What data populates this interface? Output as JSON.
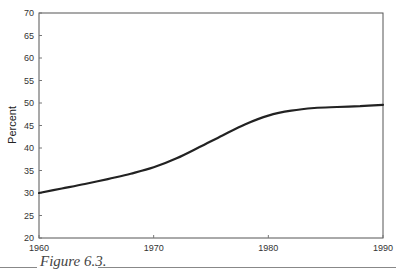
{
  "chart_data": {
    "type": "line",
    "title": "",
    "xlabel": "",
    "ylabel": "Percent",
    "xlim": [
      1960,
      1990
    ],
    "ylim": [
      20,
      70
    ],
    "grid": false,
    "legend": null,
    "x_ticks": [
      1960,
      1970,
      1980,
      1990
    ],
    "y_ticks": [
      20,
      25,
      30,
      35,
      40,
      45,
      50,
      55,
      60,
      65,
      70
    ],
    "series": [
      {
        "name": "Percent",
        "color": "#222222",
        "x": [
          1960,
          1962,
          1964,
          1966,
          1968,
          1970,
          1972,
          1974,
          1976,
          1978,
          1980,
          1982,
          1984,
          1986,
          1988,
          1990
        ],
        "values": [
          30.0,
          31.0,
          32.0,
          33.1,
          34.3,
          35.7,
          37.7,
          40.2,
          42.8,
          45.3,
          47.2,
          48.3,
          48.9,
          49.1,
          49.3,
          49.6
        ]
      }
    ]
  },
  "caption": {
    "text": "Figure 6.3."
  },
  "axes": {
    "ylabel": "Percent",
    "x_tick_labels": [
      "1960",
      "1970",
      "1980",
      "1990"
    ],
    "y_tick_labels": [
      "20",
      "25",
      "30",
      "35",
      "40",
      "45",
      "50",
      "55",
      "60",
      "65",
      "70"
    ]
  }
}
